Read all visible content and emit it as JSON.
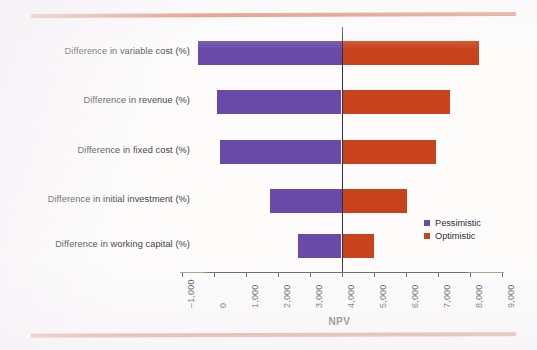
{
  "chart_data": {
    "type": "bar",
    "subtype": "tornado",
    "title": "",
    "xlabel": "NPV",
    "ylabel": "",
    "xlim": [
      -1000,
      9000
    ],
    "xticks": [
      -1000,
      0,
      1000,
      2000,
      3000,
      4000,
      5000,
      6000,
      7000,
      8000,
      9000
    ],
    "xticklabels": [
      "–1,000",
      "0",
      "1,000",
      "2,000",
      "3,000",
      "4,000",
      "5,000",
      "6,000",
      "7,000",
      "8,000",
      "9,000"
    ],
    "grid": false,
    "baseline": 4000,
    "legend_position": "right",
    "categories": [
      "Difference in variable cost (%)",
      "Difference in revenue (%)",
      "Difference in fixed cost (%)",
      "Difference in initial investment (%)",
      "Difference in working capital (%)"
    ],
    "series": [
      {
        "name": "Pessimistic",
        "color": "#6a4aa8",
        "values": [
          -500,
          100,
          200,
          1750,
          2650
        ]
      },
      {
        "name": "Optimistic",
        "color": "#c8431c",
        "values": [
          8300,
          7400,
          6950,
          6050,
          5000
        ]
      }
    ],
    "bars": [
      {
        "category": "Difference in variable cost (%)",
        "pessimistic": -500,
        "optimistic": 8300
      },
      {
        "category": "Difference in revenue (%)",
        "pessimistic": 100,
        "optimistic": 7400
      },
      {
        "category": "Difference in fixed cost (%)",
        "pessimistic": 200,
        "optimistic": 6950
      },
      {
        "category": "Difference in initial investment (%)",
        "pessimistic": 1750,
        "optimistic": 6050
      },
      {
        "category": "Difference in working capital (%)",
        "pessimistic": 2650,
        "optimistic": 5000
      }
    ],
    "legend": [
      {
        "label": "Pessimistic",
        "color": "#6a4aa8"
      },
      {
        "label": "Optimistic",
        "color": "#c8431c"
      }
    ]
  },
  "decoration": {
    "rule_color": "#c8451f"
  }
}
